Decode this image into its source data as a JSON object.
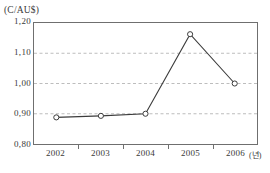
{
  "figure": {
    "unit_label": "(C/AU$)",
    "x_axis_unit": "(년)",
    "background_color": "#ffffff",
    "frame_color": "#6f6f6f",
    "grid_color": "#bdbdbd",
    "line_color": "#3c3c3c",
    "marker_fill": "#ffffff"
  },
  "chart_data": {
    "type": "line",
    "title": "",
    "subtitle": "",
    "xlabel": "(년)",
    "ylabel": "(C/AU$)",
    "categories": [
      "2002",
      "2003",
      "2004",
      "2005",
      "2006"
    ],
    "values": [
      0.888,
      0.893,
      0.9,
      1.163,
      1.0
    ],
    "series": [
      {
        "name": "C/AU$",
        "values": [
          0.888,
          0.893,
          0.9,
          1.163,
          1.0
        ]
      }
    ],
    "ylim": [
      0.8,
      1.2
    ],
    "yticks": [
      0.8,
      0.9,
      1.0,
      1.1,
      1.2
    ],
    "ytick_labels": [
      "0,80",
      "0,90",
      "1,00",
      "1,10",
      "1,20"
    ],
    "xtick_labels": [
      "2002",
      "2003",
      "2004",
      "2005",
      "2006"
    ],
    "grid": "horizontal-dashed",
    "legend": "none",
    "marker": "open-circle"
  }
}
